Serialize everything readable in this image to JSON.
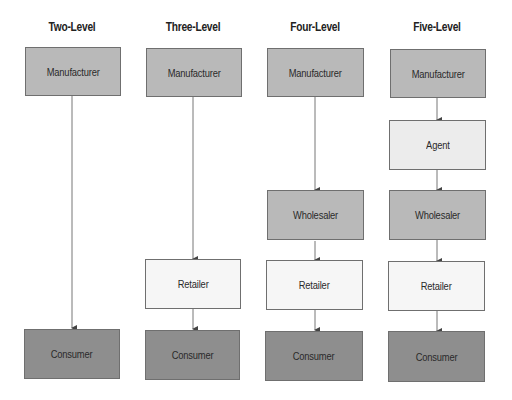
{
  "diagram": {
    "type": "distribution-channel-levels",
    "columns": [
      {
        "title": "Two-Level",
        "nodes": [
          "Manufacturer",
          "Consumer"
        ]
      },
      {
        "title": "Three-Level",
        "nodes": [
          "Manufacturer",
          "Retailer",
          "Consumer"
        ]
      },
      {
        "title": "Four-Level",
        "nodes": [
          "Manufacturer",
          "Wholesaler",
          "Retailer",
          "Consumer"
        ]
      },
      {
        "title": "Five-Level",
        "nodes": [
          "Manufacturer",
          "Agent",
          "Wholesaler",
          "Retailer",
          "Consumer"
        ]
      }
    ],
    "colors": {
      "manufacturer": "#b9b9b9",
      "agent": "#ececec",
      "wholesaler": "#b9b9b9",
      "retailer": "#f6f6f6",
      "consumer": "#8e8e8e",
      "border": "#6f6f6f",
      "arrow": "#444444"
    }
  }
}
